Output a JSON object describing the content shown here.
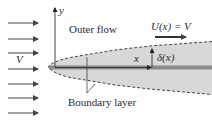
{
  "diagram": {
    "labels": {
      "y_axis": "y",
      "outer_flow": "Outer flow",
      "free_stream_velocity": "U(x) = V",
      "inlet_velocity": "V",
      "x_coordinate": "x",
      "thickness": "δ(x)",
      "boundary_layer": "Boundary layer"
    },
    "incoming_arrows_count": 7,
    "colors": {
      "arrow": "#444444",
      "boundary_layer_fill": "#d8d8d8",
      "plate": "#8a8a8a",
      "dashed_edge": "#444444",
      "text": "#2a2a2a"
    }
  }
}
